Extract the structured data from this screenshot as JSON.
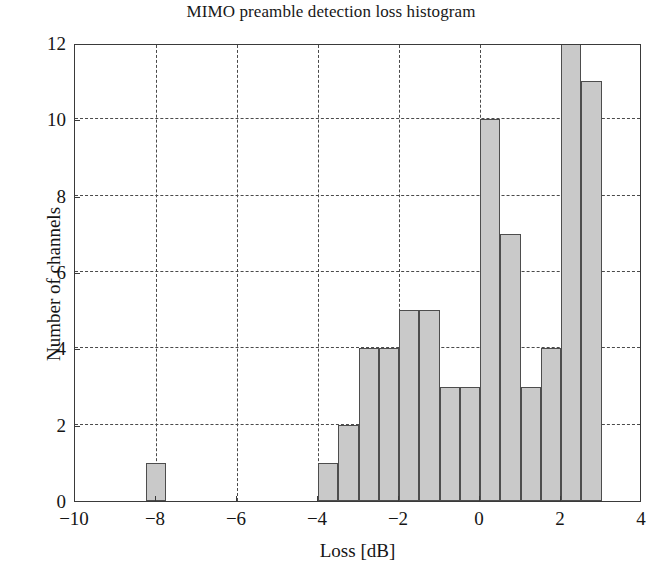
{
  "chart_data": {
    "type": "bar",
    "title": "MIMO preamble detection loss histogram",
    "xlabel": "Loss [dB]",
    "ylabel": "Number of channels",
    "xlim": [
      -10,
      4
    ],
    "ylim": [
      0,
      12
    ],
    "grid": true,
    "legend": null,
    "bin_width": 0.5,
    "bar_color": "#c9c9c9",
    "bar_edge_color": "#4d4d4d",
    "xticks": [
      -10,
      -8,
      -6,
      -4,
      -2,
      0,
      2,
      4
    ],
    "xtick_labels": [
      "-10",
      "-8",
      "-6",
      "-4",
      "-2",
      "0",
      "2",
      "4"
    ],
    "yticks": [
      0,
      2,
      4,
      6,
      8,
      10,
      12
    ],
    "ytick_labels": [
      "0",
      "2",
      "4",
      "6",
      "8",
      "10",
      "12"
    ],
    "bins": [
      {
        "x0": -8.25,
        "x1": -7.75,
        "value": 1
      },
      {
        "x0": -4.0,
        "x1": -3.5,
        "value": 1
      },
      {
        "x0": -3.5,
        "x1": -3.0,
        "value": 2
      },
      {
        "x0": -3.0,
        "x1": -2.5,
        "value": 4
      },
      {
        "x0": -2.5,
        "x1": -2.0,
        "value": 4
      },
      {
        "x0": -2.0,
        "x1": -1.5,
        "value": 5
      },
      {
        "x0": -1.5,
        "x1": -1.0,
        "value": 5
      },
      {
        "x0": -1.0,
        "x1": -0.5,
        "value": 3
      },
      {
        "x0": -0.5,
        "x1": 0.0,
        "value": 3
      },
      {
        "x0": 0.0,
        "x1": 0.5,
        "value": 10
      },
      {
        "x0": 0.5,
        "x1": 1.0,
        "value": 7
      },
      {
        "x0": 1.0,
        "x1": 1.5,
        "value": 3
      },
      {
        "x0": 1.5,
        "x1": 2.0,
        "value": 4
      },
      {
        "x0": 2.0,
        "x1": 2.5,
        "value": 12
      },
      {
        "x0": 2.5,
        "x1": 3.0,
        "value": 11
      }
    ]
  }
}
